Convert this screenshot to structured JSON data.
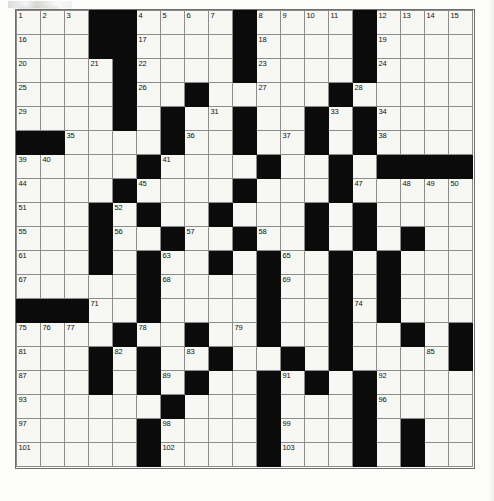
{
  "document": {
    "kind": "crossword-puzzle-grid",
    "title": "",
    "rows": 19,
    "columns": 19,
    "cell_size_px": 24,
    "colors": {
      "paper": "#fdfdfc",
      "cell_fill": "#f7f7f3",
      "block_fill": "#0b0b0b",
      "cell_border": "#8c8c8c",
      "number_text": "#111111"
    }
  },
  "grid": {
    "legend": {
      "block": "#",
      "open_cell": ".",
      "note": "Each row string has 19 characters; '#' is a filled (black) square."
    },
    "pattern": [
      "...##....#....#....",
      "...##....#....#....",
      "....#....#....#....",
      "....#..#.....#.....",
      "....#.#..#..#.#....",
      "##....#..#..#.#....",
      ".....#....#..#.####",
      "....#....#...#.....",
      "...#.#..#...#.#....",
      "...#..#..#..#.#.#..",
      "...#.#..#.#..#.#...",
      ".....#....#..#.#...",
      "###..#....#..#.#...",
      "....#..#..#..#..#.#",
      "...#.#..#..#.#....#",
      "...#.#.#..#.#.#....",
      "......#...#...#....",
      ".....#....#...#.#..",
      ".....#....#...#.#.."
    ],
    "numbers": [
      {
        "n": 1,
        "row": 1,
        "col": 1
      },
      {
        "n": 2,
        "row": 1,
        "col": 2
      },
      {
        "n": 3,
        "row": 1,
        "col": 3
      },
      {
        "n": 4,
        "row": 1,
        "col": 6
      },
      {
        "n": 5,
        "row": 1,
        "col": 7
      },
      {
        "n": 6,
        "row": 1,
        "col": 8
      },
      {
        "n": 7,
        "row": 1,
        "col": 9
      },
      {
        "n": 8,
        "row": 1,
        "col": 11
      },
      {
        "n": 9,
        "row": 1,
        "col": 12
      },
      {
        "n": 10,
        "row": 1,
        "col": 13
      },
      {
        "n": 11,
        "row": 1,
        "col": 14
      },
      {
        "n": 12,
        "row": 1,
        "col": 16
      },
      {
        "n": 13,
        "row": 1,
        "col": 17
      },
      {
        "n": 14,
        "row": 1,
        "col": 18
      },
      {
        "n": 15,
        "row": 1,
        "col": 19
      },
      {
        "n": 16,
        "row": 2,
        "col": 1
      },
      {
        "n": 17,
        "row": 2,
        "col": 6
      },
      {
        "n": 18,
        "row": 2,
        "col": 11
      },
      {
        "n": 19,
        "row": 2,
        "col": 16
      },
      {
        "n": 20,
        "row": 3,
        "col": 1
      },
      {
        "n": 21,
        "row": 3,
        "col": 4
      },
      {
        "n": 22,
        "row": 3,
        "col": 6
      },
      {
        "n": 23,
        "row": 3,
        "col": 11
      },
      {
        "n": 24,
        "row": 3,
        "col": 16
      },
      {
        "n": 25,
        "row": 4,
        "col": 1
      },
      {
        "n": 26,
        "row": 4,
        "col": 6
      },
      {
        "n": 27,
        "row": 4,
        "col": 11
      },
      {
        "n": 28,
        "row": 4,
        "col": 15
      },
      {
        "n": 29,
        "row": 5,
        "col": 1
      },
      {
        "n": 30,
        "row": 5,
        "col": 5
      },
      {
        "n": 31,
        "row": 5,
        "col": 9
      },
      {
        "n": 32,
        "row": 5,
        "col": 13
      },
      {
        "n": 33,
        "row": 5,
        "col": 14
      },
      {
        "n": 34,
        "row": 5,
        "col": 16
      },
      {
        "n": 35,
        "row": 6,
        "col": 3
      },
      {
        "n": 36,
        "row": 6,
        "col": 8
      },
      {
        "n": 37,
        "row": 6,
        "col": 12
      },
      {
        "n": 38,
        "row": 6,
        "col": 16
      },
      {
        "n": 39,
        "row": 7,
        "col": 1
      },
      {
        "n": 40,
        "row": 7,
        "col": 2
      },
      {
        "n": 41,
        "row": 7,
        "col": 7
      },
      {
        "n": 42,
        "row": 7,
        "col": 11
      },
      {
        "n": 43,
        "row": 7,
        "col": 14
      },
      {
        "n": 44,
        "row": 8,
        "col": 1
      },
      {
        "n": 45,
        "row": 8,
        "col": 6
      },
      {
        "n": 46,
        "row": 8,
        "col": 10
      },
      {
        "n": 47,
        "row": 8,
        "col": 15
      },
      {
        "n": 48,
        "row": 8,
        "col": 17
      },
      {
        "n": 49,
        "row": 8,
        "col": 18
      },
      {
        "n": 50,
        "row": 8,
        "col": 19
      },
      {
        "n": 51,
        "row": 9,
        "col": 1
      },
      {
        "n": 52,
        "row": 9,
        "col": 5
      },
      {
        "n": 53,
        "row": 9,
        "col": 9
      },
      {
        "n": 54,
        "row": 9,
        "col": 13
      },
      {
        "n": 55,
        "row": 10,
        "col": 1
      },
      {
        "n": 56,
        "row": 10,
        "col": 5
      },
      {
        "n": 57,
        "row": 10,
        "col": 8
      },
      {
        "n": 58,
        "row": 10,
        "col": 11
      },
      {
        "n": 59,
        "row": 10,
        "col": 13
      },
      {
        "n": 60,
        "row": 10,
        "col": 17
      },
      {
        "n": 61,
        "row": 11,
        "col": 1
      },
      {
        "n": 62,
        "row": 11,
        "col": 4
      },
      {
        "n": 63,
        "row": 11,
        "col": 7
      },
      {
        "n": 64,
        "row": 11,
        "col": 9
      },
      {
        "n": 65,
        "row": 11,
        "col": 12
      },
      {
        "n": 66,
        "row": 11,
        "col": 16
      },
      {
        "n": 67,
        "row": 12,
        "col": 1
      },
      {
        "n": 68,
        "row": 12,
        "col": 7
      },
      {
        "n": 69,
        "row": 12,
        "col": 12
      },
      {
        "n": 70,
        "row": 12,
        "col": 16
      },
      {
        "n": 71,
        "row": 13,
        "col": 4
      },
      {
        "n": 72,
        "row": 13,
        "col": 6
      },
      {
        "n": 73,
        "row": 13,
        "col": 11
      },
      {
        "n": 74,
        "row": 13,
        "col": 15
      },
      {
        "n": 75,
        "row": 14,
        "col": 1
      },
      {
        "n": 76,
        "row": 14,
        "col": 2
      },
      {
        "n": 77,
        "row": 14,
        "col": 3
      },
      {
        "n": 78,
        "row": 14,
        "col": 6
      },
      {
        "n": 79,
        "row": 14,
        "col": 10
      },
      {
        "n": 80,
        "row": 14,
        "col": 14
      },
      {
        "n": 81,
        "row": 15,
        "col": 1
      },
      {
        "n": 82,
        "row": 15,
        "col": 5
      },
      {
        "n": 83,
        "row": 15,
        "col": 8
      },
      {
        "n": 84,
        "row": 15,
        "col": 12
      },
      {
        "n": 85,
        "row": 15,
        "col": 18
      },
      {
        "n": 86,
        "row": 15,
        "col": 19
      },
      {
        "n": 87,
        "row": 16,
        "col": 1
      },
      {
        "n": 88,
        "row": 16,
        "col": 4
      },
      {
        "n": 89,
        "row": 16,
        "col": 7
      },
      {
        "n": 90,
        "row": 16,
        "col": 8
      },
      {
        "n": 91,
        "row": 16,
        "col": 12
      },
      {
        "n": 92,
        "row": 16,
        "col": 16
      },
      {
        "n": 93,
        "row": 17,
        "col": 1
      },
      {
        "n": 94,
        "row": 17,
        "col": 7
      },
      {
        "n": 95,
        "row": 17,
        "col": 11
      },
      {
        "n": 96,
        "row": 17,
        "col": 16
      },
      {
        "n": 97,
        "row": 18,
        "col": 1
      },
      {
        "n": 98,
        "row": 18,
        "col": 7
      },
      {
        "n": 99,
        "row": 18,
        "col": 12
      },
      {
        "n": 100,
        "row": 18,
        "col": 17
      },
      {
        "n": 101,
        "row": 19,
        "col": 1
      },
      {
        "n": 102,
        "row": 19,
        "col": 7
      },
      {
        "n": 103,
        "row": 19,
        "col": 12
      },
      {
        "n": 104,
        "row": 19,
        "col": 17
      }
    ]
  }
}
